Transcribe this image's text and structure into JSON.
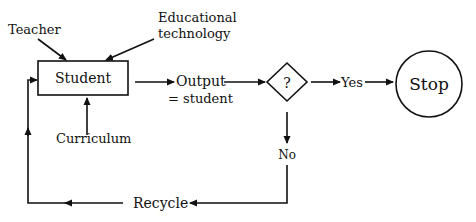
{
  "diagram": {
    "nodes": {
      "student": "Student",
      "output_line1": "Output",
      "output_line2": "= student",
      "decision": "?",
      "stop": "Stop"
    },
    "inputs": {
      "teacher": "Teacher",
      "edtech_line1": "Educational",
      "edtech_line2": "technology",
      "curriculum": "Curriculum"
    },
    "edges": {
      "yes": "Yes",
      "no": "No",
      "recycle": "Recycle"
    },
    "colors": {
      "line": "#111111",
      "background": "#ffffff"
    }
  }
}
